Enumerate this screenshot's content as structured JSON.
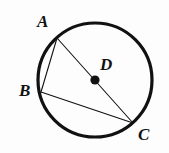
{
  "figure": {
    "background_color": "#fdfdfd",
    "stroke_color": "#111111",
    "circle": {
      "name": "circle-D",
      "center_x": 95,
      "center_y": 80,
      "radius": 57,
      "stroke_width": 3.2
    },
    "center_point": {
      "name": "center-point-D",
      "x": 95,
      "y": 80,
      "dot_radius": 4.6
    },
    "points": [
      {
        "id": "A",
        "label": "A",
        "x": 57,
        "y": 38
      },
      {
        "id": "B",
        "label": "B",
        "x": 41,
        "y": 92
      },
      {
        "id": "C",
        "label": "C",
        "x": 133,
        "y": 123
      },
      {
        "id": "D",
        "label": "D",
        "x": 95,
        "y": 80
      }
    ],
    "segments": [
      {
        "id": "AC",
        "from": "A",
        "to": "C",
        "x1": 57,
        "y1": 38,
        "x2": 133,
        "y2": 123,
        "stroke_width": 1.1,
        "note": "diameter through D"
      },
      {
        "id": "AB",
        "from": "A",
        "to": "B",
        "x1": 57,
        "y1": 38,
        "x2": 41,
        "y2": 92,
        "stroke_width": 1.1,
        "note": "chord"
      },
      {
        "id": "BC",
        "from": "B",
        "to": "C",
        "x1": 41,
        "y1": 92,
        "x2": 133,
        "y2": 123,
        "stroke_width": 1.1,
        "note": "chord"
      }
    ],
    "labels": {
      "A": "A",
      "B": "B",
      "C": "C",
      "D": "D"
    }
  }
}
